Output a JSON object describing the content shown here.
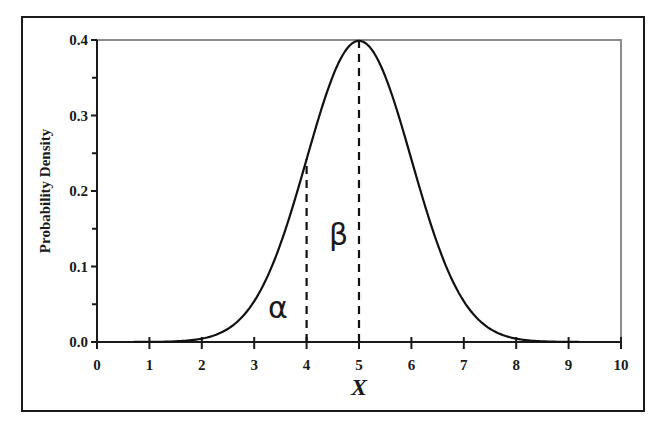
{
  "chart_data": {
    "type": "line",
    "title": "",
    "xlabel": "X",
    "ylabel": "Probability Density",
    "xlim": [
      0,
      10
    ],
    "ylim": [
      0.0,
      0.4
    ],
    "x_ticks": [
      "0",
      "1",
      "2",
      "3",
      "4",
      "5",
      "6",
      "7",
      "8",
      "9",
      "10"
    ],
    "y_ticks": [
      "0.0",
      "0.1",
      "0.2",
      "0.3",
      "0.4"
    ],
    "y_minor_ticks": [
      0.05,
      0.15,
      0.25,
      0.35
    ],
    "grid": false,
    "legend": null,
    "series": [
      {
        "name": "Normal density (mean 5, sd 1)",
        "distribution": {
          "mean": 5,
          "sd": 1
        },
        "x": [
          0.7,
          1.0,
          1.5,
          2.0,
          2.5,
          3.0,
          3.5,
          4.0,
          4.5,
          5.0,
          5.5,
          6.0,
          6.5,
          7.0,
          7.5,
          8.0,
          8.5,
          9.0,
          9.2
        ],
        "y": [
          0.0,
          0.0001,
          0.0009,
          0.0044,
          0.0175,
          0.054,
          0.1295,
          0.242,
          0.3521,
          0.3989,
          0.3521,
          0.242,
          0.1295,
          0.054,
          0.0175,
          0.0044,
          0.0009,
          0.0001,
          0.0
        ]
      }
    ],
    "reference_lines": [
      {
        "x": 4,
        "y_top": 0.242,
        "style": "dashed"
      },
      {
        "x": 5,
        "y_top": 0.3989,
        "style": "dashed"
      }
    ],
    "annotations": [
      {
        "text": "α",
        "x": 3.5,
        "y": 0.04
      },
      {
        "text": "β",
        "x": 4.6,
        "y": 0.14
      }
    ]
  },
  "labels": {
    "ylabel": "Probability Density",
    "xlabel": "X",
    "alpha": "α",
    "beta": "β",
    "x_ticks": [
      "0",
      "1",
      "2",
      "3",
      "4",
      "5",
      "6",
      "7",
      "8",
      "9",
      "10"
    ],
    "y_ticks": [
      "0.0",
      "0.1",
      "0.2",
      "0.3",
      "0.4"
    ]
  }
}
